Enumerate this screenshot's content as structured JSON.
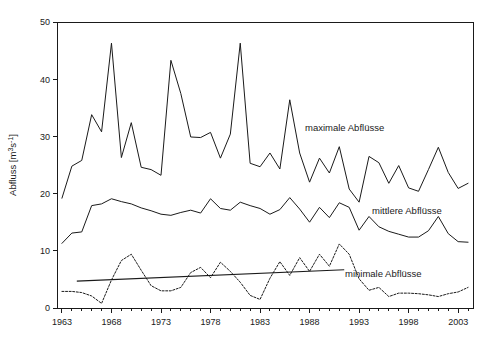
{
  "chart_data": {
    "type": "line",
    "title": "",
    "xlabel": "",
    "ylabel": "Abfluss [m³s⁻¹]",
    "ylabel_base": "Abfluss [m",
    "ylabel_sup1": "3",
    "ylabel_mid": "s",
    "ylabel_sup2": "-1",
    "ylabel_end": "]",
    "xlim": [
      1962.5,
      2004.5
    ],
    "ylim": [
      0,
      50
    ],
    "grid": false,
    "legend_position": "inline-annotations",
    "y_ticks": [
      0,
      10,
      20,
      30,
      40,
      50
    ],
    "y_tick_labels": [
      "0",
      "10",
      "20",
      "30",
      "40",
      "50"
    ],
    "x_tick_labels": [
      "1963",
      "1968",
      "1973",
      "1978",
      "1983",
      "1988",
      "1993",
      "1998",
      "2003"
    ],
    "x_tick_values": [
      1963,
      1968,
      1973,
      1978,
      1983,
      1988,
      1993,
      1998,
      2003
    ],
    "x_minor_start": 1963,
    "x_minor_end": 2004,
    "x": [
      1963,
      1964,
      1965,
      1966,
      1967,
      1968,
      1969,
      1970,
      1971,
      1972,
      1973,
      1974,
      1975,
      1976,
      1977,
      1978,
      1979,
      1980,
      1981,
      1982,
      1983,
      1984,
      1985,
      1986,
      1987,
      1988,
      1989,
      1990,
      1991,
      1992,
      1993,
      1994,
      1995,
      1996,
      1997,
      1998,
      1999,
      2000,
      2001,
      2002,
      2003,
      2004
    ],
    "series": [
      {
        "name": "maximale Abflüsse",
        "label": "maximale Abflüsse",
        "style": "solid",
        "values": [
          19.2,
          24.8,
          25.8,
          33.8,
          30.8,
          46.3,
          26.3,
          32.4,
          24.6,
          24.2,
          23.2,
          43.3,
          37.5,
          29.9,
          29.8,
          30.7,
          26.2,
          30.4,
          46.3,
          25.3,
          24.7,
          27.1,
          24.3,
          36.4,
          27.1,
          22.0,
          26.2,
          23.6,
          28.2,
          20.8,
          18.5,
          26.5,
          25.4,
          21.8,
          24.9,
          21.0,
          20.4,
          24.2,
          28.1,
          23.7,
          20.9,
          21.8
        ]
      },
      {
        "name": "mittlere Abflüsse",
        "label": "mittlere Abflüsse",
        "style": "solid",
        "values": [
          11.3,
          13.1,
          13.3,
          17.9,
          18.2,
          19.1,
          18.6,
          18.2,
          17.5,
          17.0,
          16.4,
          16.2,
          16.7,
          17.1,
          16.6,
          19.1,
          17.4,
          17.1,
          18.5,
          17.9,
          17.4,
          16.4,
          17.2,
          19.3,
          17.3,
          15.0,
          17.6,
          15.8,
          18.4,
          17.6,
          13.6,
          16.0,
          14.2,
          13.4,
          12.9,
          12.4,
          12.4,
          13.5,
          16.0,
          13.0,
          11.6,
          11.5
        ]
      },
      {
        "name": "minimale Abflüsse",
        "label": "minimale Abflüsse",
        "style": "dotted",
        "values": [
          2.9,
          2.9,
          2.7,
          2.1,
          0.8,
          4.9,
          8.3,
          9.4,
          6.6,
          3.9,
          3.0,
          3.0,
          3.6,
          6.2,
          7.1,
          5.3,
          8.0,
          6.4,
          4.5,
          2.2,
          1.5,
          5.2,
          8.1,
          5.7,
          8.8,
          6.4,
          9.4,
          7.3,
          11.2,
          9.4,
          5.1,
          3.1,
          3.6,
          2.0,
          2.6,
          2.6,
          2.5,
          2.3,
          2.0,
          2.5,
          2.8,
          3.6
        ]
      }
    ],
    "trend": {
      "name": "minimal-trend",
      "x": [
        1964.5,
        1991.5
      ],
      "y": [
        4.7,
        6.7
      ],
      "style": "solid"
    },
    "annotations": [
      {
        "text": "maximale Abflüsse",
        "x_px": 305,
        "y_px": 131
      },
      {
        "text": "mittlere Abflüsse",
        "x_px": 372,
        "y_px": 214
      },
      {
        "text": "minimale Abflüsse",
        "x_px": 345,
        "y_px": 277
      }
    ]
  },
  "plot_geometry": {
    "left_px": 57,
    "right_px": 473,
    "top_px": 22,
    "bottom_px": 308
  },
  "colors": {
    "ink": "#1a1a1a",
    "background": "#ffffff"
  }
}
